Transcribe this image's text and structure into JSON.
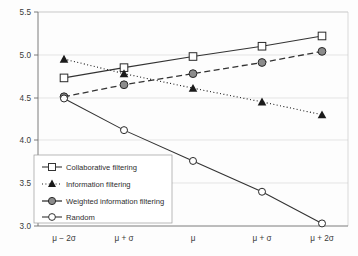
{
  "chart_data": {
    "type": "line",
    "title": "",
    "xlabel": "",
    "ylabel": "",
    "categories": [
      "μ − 2σ",
      "μ + σ",
      "μ",
      "μ + σ",
      "μ + 2σ"
    ],
    "ylim": [
      3.0,
      5.5
    ],
    "yticks": [
      "3.0",
      "3.5",
      "4.0",
      "4.5",
      "5.0",
      "5.5"
    ],
    "ytick_values": [
      3.0,
      3.5,
      4.0,
      4.5,
      5.0,
      5.5
    ],
    "grid": true,
    "legend_position": "lower-left",
    "series": [
      {
        "name": "Collaborative filtering",
        "values": [
          4.73,
          4.85,
          4.98,
          5.1,
          5.22
        ],
        "marker": "open-square",
        "line_style": "solid",
        "color": "#333333"
      },
      {
        "name": "Information filtering",
        "values": [
          4.95,
          4.78,
          4.61,
          4.45,
          4.3
        ],
        "marker": "filled-triangle",
        "line_style": "dotted",
        "color": "#1a1a1a"
      },
      {
        "name": "Weighted information filtering",
        "values": [
          4.51,
          4.65,
          4.78,
          4.91,
          5.04
        ],
        "marker": "filled-circle",
        "line_style": "dashed",
        "color": "#333333"
      },
      {
        "name": "Random",
        "values": [
          4.49,
          4.12,
          3.76,
          3.4,
          3.03
        ],
        "marker": "open-circle",
        "line_style": "solid",
        "color": "#333333"
      }
    ]
  },
  "legend": {
    "items": [
      {
        "label": "Collaborative filtering"
      },
      {
        "label": "Information filtering"
      },
      {
        "label": "Weighted information filtering"
      },
      {
        "label": "Random"
      }
    ]
  },
  "axes": {
    "y_tick_labels": [
      "5.5",
      "5.0",
      "4.5",
      "4.0",
      "3.5",
      "3.0"
    ],
    "x_tick_labels": [
      "μ − 2σ",
      "μ + σ",
      "μ",
      "μ + σ",
      "μ + 2σ"
    ]
  }
}
